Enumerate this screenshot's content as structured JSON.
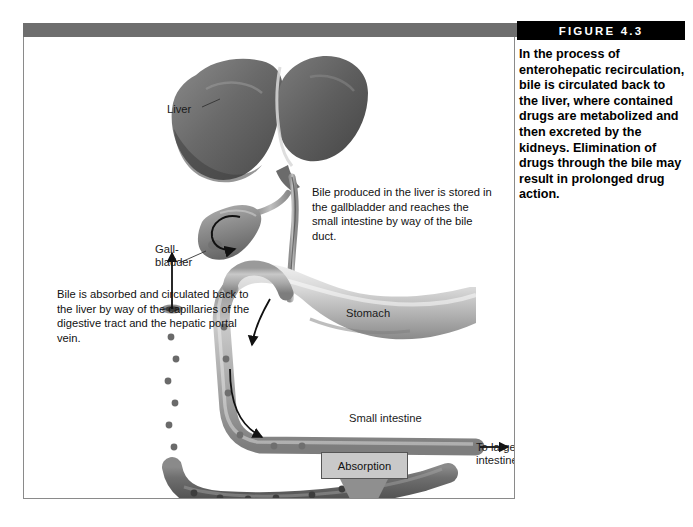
{
  "figure": {
    "header_label": "FIGURE 4.3",
    "caption": "In the process of enterohepatic recirculation, bile is circulated back to the liver, where contained drugs are metabolized and then excreted by the kidneys. Elimination of drugs through the bile may result in prolonged drug action."
  },
  "diagram": {
    "labels": {
      "liver": "Liver",
      "gallbladder": "Gall-\nbladder",
      "stomach": "Stomach",
      "small_intestine": "Small intestine",
      "to_large_intestine": "To large\nintestine",
      "bloodstream": "Bloodstream",
      "absorption": "Absorption"
    },
    "annotations": {
      "bile_duct_note": "Bile produced in the liver is stored in the gallbladder and reaches the small intestine by way of the bile duct.",
      "bile_absorbed_note": "Bile is absorbed and circulated back to the liver by way of the capillaries of the digestive tract and the hepatic portal vein."
    }
  },
  "colors": {
    "header_bar": "#000000",
    "top_gray_bar": "#6e6e6e",
    "frame_border": "#8a8a8a",
    "absorption_box": "#c9c9c9",
    "organ_dark": "#5d5d5d",
    "organ_mid": "#8d8d8d",
    "organ_light": "#c4c4c4"
  }
}
